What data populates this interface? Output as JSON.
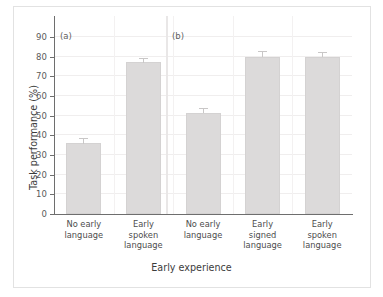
{
  "figure": {
    "background": "#ffffff",
    "frame_color": "#e2e2e2",
    "bar_color": "#dcdada",
    "axis_color": "#6e6e6e",
    "grid_color": "#f0eeee"
  },
  "chart_data": {
    "type": "bar",
    "title": "",
    "xlabel": "Early experience",
    "ylabel": "Task performance (%)",
    "ylim": [
      0,
      100
    ],
    "ytick_values": [
      0,
      10,
      20,
      30,
      40,
      50,
      60,
      70,
      80,
      90
    ],
    "ytick_labels": [
      "0",
      "10",
      "20",
      "30",
      "40",
      "50",
      "60",
      "70",
      "80",
      "90"
    ],
    "grid": true,
    "legend": "none",
    "categories": [
      "No early\nlanguage",
      "Early\nspoken\nlanguage",
      "No early\nlanguage",
      "Early\nsigned\nlanguage",
      "Early\nspoken\nlanguage"
    ],
    "values": [
      36,
      77,
      51.5,
      80,
      80
    ],
    "errors": [
      2,
      2,
      2,
      2.5,
      2
    ],
    "panels": [
      {
        "tag": "(a)",
        "bar_indices": [
          0,
          1
        ]
      },
      {
        "tag": "(b)",
        "bar_indices": [
          2,
          3,
          4
        ]
      }
    ],
    "annotations": [
      "(a)",
      "(b)"
    ]
  },
  "axes": {
    "y_title": "Task performance (%)",
    "x_title": "Early experience",
    "y_ticks": [
      "90",
      "80",
      "70",
      "60",
      "50",
      "40",
      "30",
      "20",
      "10",
      "0"
    ],
    "x_ticks": [
      "No early\nlanguage",
      "Early\nspoken\nlanguage",
      "No early\nlanguage",
      "Early\nsigned\nlanguage",
      "Early\nspoken\nlanguage"
    ]
  },
  "panel_tags": {
    "a": "(a)",
    "b": "(b)"
  }
}
